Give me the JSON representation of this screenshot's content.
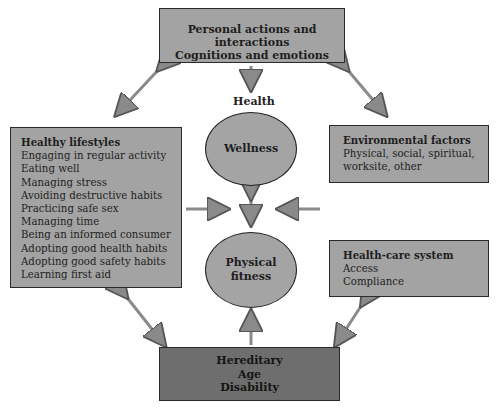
{
  "top_box": {
    "lines": [
      "Personal actions and interactions",
      "Cognitions and emotions"
    ]
  },
  "health_label": "Health",
  "wellness": "Wellness",
  "physical_fitness": {
    "lines": [
      "Physical",
      "fitness"
    ]
  },
  "healthy_lifestyles": {
    "title": "Healthy lifestyles",
    "items": [
      "Engaging in regular activity",
      "Eating well",
      "Managing stress",
      "Avoiding destructive habits",
      "Practicing safe sex",
      "Managing time",
      "Being an informed consumer",
      "Adopting good health habits",
      "Adopting good safety habits",
      "Learning first aid"
    ]
  },
  "environmental_factors": {
    "title": "Environmental factors",
    "lines": [
      "Physical, social, spiritual,",
      "worksite, other"
    ]
  },
  "health_care_system": {
    "title": "Health-care system",
    "lines": [
      "Access",
      "Compliance"
    ]
  },
  "bottom_box": {
    "lines": [
      "Hereditary",
      "Age",
      "Disability"
    ]
  },
  "colors": {
    "box_fill": "#a3a3a3",
    "bottom_fill": "#6e6e6e",
    "arrow": "#8a8a8a",
    "border": "#2a2a2a"
  }
}
